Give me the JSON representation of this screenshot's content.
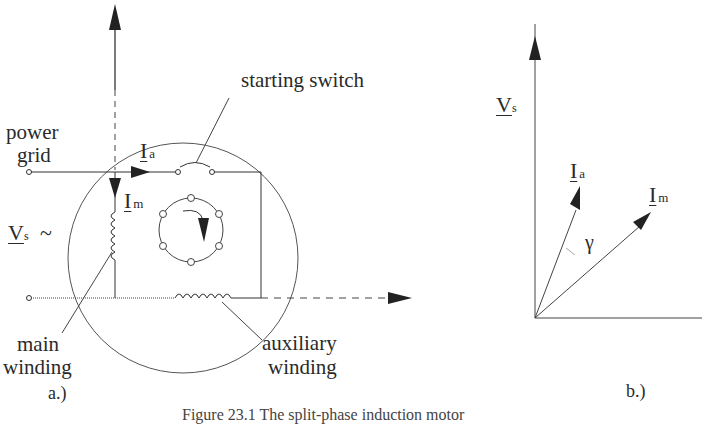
{
  "figure": {
    "caption": "Figure 23.1 The split-phase induction motor",
    "panel_a_label": "a.)",
    "panel_b_label": "b.)"
  },
  "panel_a": {
    "labels": {
      "power_grid_line1": "power",
      "power_grid_line2": "grid",
      "starting_switch": "starting switch",
      "main_winding_line1": "main",
      "main_winding_line2": "winding",
      "auxiliary_winding_line1": "auxiliary",
      "auxiliary_winding_line2": "winding"
    },
    "symbols": {
      "Ia": {
        "main": "I",
        "sub": "a"
      },
      "Im": {
        "main": "I",
        "sub": "m"
      },
      "Vs": {
        "main": "V",
        "sub": "s",
        "suffix": "~"
      }
    }
  },
  "panel_b": {
    "symbols": {
      "Vs": {
        "main": "V",
        "sub": "s"
      },
      "Ia": {
        "main": "I",
        "sub": "a"
      },
      "Im": {
        "main": "I",
        "sub": "m"
      },
      "gamma": "γ"
    }
  },
  "colors": {
    "line": "#333333",
    "circle": "#555555",
    "background": "#ffffff"
  }
}
